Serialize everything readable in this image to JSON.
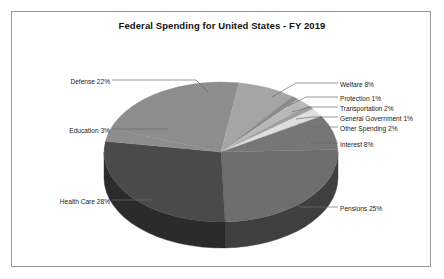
{
  "chart_data": {
    "type": "pie",
    "title": "Federal Spending for United States - FY 2019",
    "xlabel": "",
    "ylabel": "",
    "legend_position": "callout-labels",
    "grid": false,
    "three_d": true,
    "units": "percent",
    "categories": [
      "Pensions",
      "Health Care",
      "Education",
      "Defense",
      "Welfare",
      "Protection",
      "Transportation",
      "General Government",
      "Other Spending",
      "Interest"
    ],
    "values": [
      25,
      28,
      3,
      22,
      8,
      1,
      2,
      1,
      2,
      8
    ],
    "slices": [
      {
        "label": "Pensions 25%",
        "name": "Pensions",
        "value": 25,
        "color": "#6e6e6e",
        "side_color": "#3f3f3f",
        "side": "right"
      },
      {
        "label": "Health Care 28%",
        "name": "Health Care",
        "value": 28,
        "color": "#4a4a4a",
        "side_color": "#2b2b2b",
        "side": "left"
      },
      {
        "label": "Education 3%",
        "name": "Education",
        "value": 3,
        "color": "#8d8d8d",
        "side_color": "#8d8d8d",
        "side": "left"
      },
      {
        "label": "Defense 22%",
        "name": "Defense",
        "value": 22,
        "color": "#8d8d8d",
        "side_color": "#8d8d8d",
        "side": "left"
      },
      {
        "label": "Welfare 8%",
        "name": "Welfare",
        "value": 8,
        "color": "#a5a5a5",
        "side_color": "#a5a5a5",
        "side": "right"
      },
      {
        "label": "Protection 1%",
        "name": "Protection",
        "value": 1,
        "color": "#8a8a8a",
        "side_color": "#8a8a8a",
        "side": "right"
      },
      {
        "label": "Transportation 2%",
        "name": "Transportation",
        "value": 2,
        "color": "#b8b8b8",
        "side_color": "#b8b8b8",
        "side": "right"
      },
      {
        "label": "General Government 1%",
        "name": "General Government",
        "value": 1,
        "color": "#9d9d9d",
        "side_color": "#9d9d9d",
        "side": "right"
      },
      {
        "label": "Other Spending 2%",
        "name": "Other Spending",
        "value": 2,
        "color": "#dedede",
        "side_color": "#dedede",
        "side": "right"
      },
      {
        "label": "Interest 8%",
        "name": "Interest",
        "value": 8,
        "color": "#767676",
        "side_color": "#4a4a4a",
        "side": "right"
      }
    ]
  },
  "labels": {
    "defense": "Defense 22%",
    "education": "Education 3%",
    "health_care": "Health Care 28%",
    "pensions": "Pensions 25%",
    "welfare": "Welfare 8%",
    "protection": "Protection 1%",
    "transportation": "Transportation 2%",
    "general_government": "General Government 1%",
    "other_spending": "Other Spending 2%",
    "interest": "Interest 8%"
  },
  "colors": {
    "border": "#9a9a9a",
    "background": "#ffffff",
    "text": "#1a1a1a",
    "leader_line": "#6b6b6b"
  }
}
